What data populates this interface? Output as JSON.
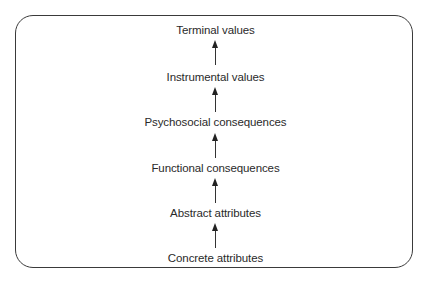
{
  "diagram": {
    "type": "means-end chain",
    "levels": [
      {
        "label": "Terminal values",
        "top": 24
      },
      {
        "label": "Instrumental values",
        "top": 71
      },
      {
        "label": "Psychosocial consequences",
        "top": 116
      },
      {
        "label": "Functional consequences",
        "top": 162
      },
      {
        "label": "Abstract attributes",
        "top": 207
      },
      {
        "label": "Concrete attributes",
        "top": 252
      }
    ],
    "arrows": [
      {
        "from": "Instrumental values",
        "to": "Terminal values"
      },
      {
        "from": "Psychosocial consequences",
        "to": "Instrumental values"
      },
      {
        "from": "Functional consequences",
        "to": "Psychosocial consequences"
      },
      {
        "from": "Abstract attributes",
        "to": "Functional consequences"
      },
      {
        "from": "Concrete attributes",
        "to": "Abstract attributes"
      }
    ]
  }
}
